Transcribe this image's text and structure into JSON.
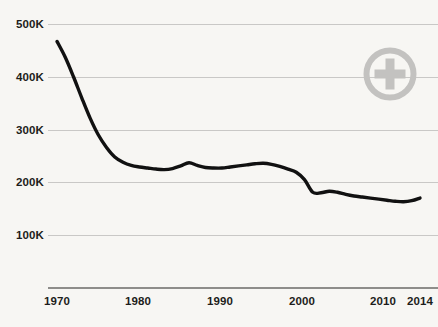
{
  "chart_data": {
    "type": "line",
    "title": "",
    "subtitle": "",
    "xlabel": "",
    "ylabel": "",
    "xlim": [
      1970,
      2014
    ],
    "ylim": [
      0,
      500000
    ],
    "grid": true,
    "legend_position": "none",
    "x_tick_labels": [
      "1970",
      "1980",
      "1990",
      "2000",
      "2010",
      "2014"
    ],
    "x_ticks": [
      1970,
      1980,
      1990,
      2000,
      2010,
      2014
    ],
    "y_tick_labels": [
      "500K",
      "400K",
      "300K",
      "200K",
      "100K"
    ],
    "y_ticks": [
      500000,
      400000,
      300000,
      200000,
      100000
    ],
    "line_color": "#111111",
    "grid_color": "#c9c8c6",
    "axis_color": "#8e8d8a",
    "background_color": "#f7f6f3",
    "series": [
      {
        "name": "value",
        "x": [
          1970,
          1971,
          1972,
          1973,
          1974,
          1975,
          1976,
          1977,
          1978,
          1979,
          1980,
          1981,
          1982,
          1983,
          1984,
          1985,
          1986,
          1987,
          1988,
          1989,
          1990,
          1991,
          1992,
          1993,
          1994,
          1995,
          1996,
          1997,
          1998,
          1999,
          2000,
          2001,
          2002,
          2003,
          2004,
          2005,
          2006,
          2007,
          2008,
          2009,
          2010,
          2011,
          2012,
          2013,
          2014
        ],
        "values": [
          467000,
          437000,
          400000,
          360000,
          322000,
          290000,
          266000,
          248000,
          238000,
          232000,
          229000,
          227000,
          225000,
          224000,
          226000,
          231000,
          237000,
          232000,
          228000,
          227000,
          227000,
          229000,
          231000,
          233000,
          235000,
          236000,
          234000,
          230000,
          225000,
          219000,
          205000,
          181000,
          180000,
          183000,
          181000,
          177000,
          174000,
          172000,
          170000,
          168000,
          166000,
          164000,
          163000,
          165000,
          170000
        ]
      }
    ],
    "annotations": [
      {
        "name": "zoom-plus-badge",
        "icon": "plus-circle-icon",
        "color": "#c3c2c0"
      }
    ]
  },
  "yaxis": {
    "ticks": [
      {
        "label": "500K",
        "top": 18
      },
      {
        "label": "400K",
        "top": 71
      },
      {
        "label": "300K",
        "top": 124
      },
      {
        "label": "200K",
        "top": 176
      },
      {
        "label": "100K",
        "top": 229
      }
    ]
  },
  "gridlines": [
    24,
    77,
    130,
    182,
    235
  ],
  "baseline_top": 287,
  "xaxis": {
    "ticks": [
      {
        "label": "1970",
        "left": 57
      },
      {
        "label": "1980",
        "left": 138
      },
      {
        "label": "1990",
        "left": 220
      },
      {
        "label": "2000",
        "left": 302
      },
      {
        "label": "2010",
        "left": 383
      },
      {
        "label": "2014",
        "left": 420
      }
    ]
  }
}
